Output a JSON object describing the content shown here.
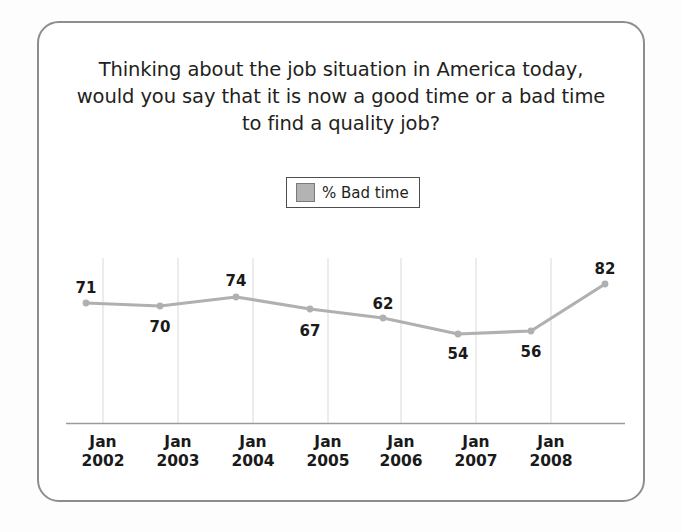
{
  "frame": {
    "border_color": "#8d8d8d",
    "background": "#ffffff"
  },
  "title": {
    "line1": "Thinking about the job situation in America today,",
    "line2": "would you say that it is now a good time or a bad time",
    "line3": "to find a quality job?"
  },
  "legend": {
    "swatch_name": "legend-swatch-bad-time",
    "swatch_color": "#b3b3b3",
    "label": "% Bad time"
  },
  "axis": {
    "tick_labels": [
      {
        "month": "Jan",
        "year": "2002"
      },
      {
        "month": "Jan",
        "year": "2003"
      },
      {
        "month": "Jan",
        "year": "2004"
      },
      {
        "month": "Jan",
        "year": "2005"
      },
      {
        "month": "Jan",
        "year": "2006"
      },
      {
        "month": "Jan",
        "year": "2007"
      },
      {
        "month": "Jan",
        "year": "2008"
      }
    ]
  },
  "chart_data": {
    "type": "line",
    "title": "Thinking about the job situation in America today, would you say that it is now a good time or a bad time to find a quality job?",
    "xlabel": "",
    "ylabel": "",
    "grid": "vertical-only",
    "legend_position": "top-center",
    "series": [
      {
        "name": "% Bad time",
        "color": "#b3b3b3",
        "marker_color": "#b0b0b0",
        "values": [
          71,
          70,
          74,
          67,
          62,
          54,
          56,
          82
        ]
      }
    ],
    "categories": [
      "Jan 2002",
      "Jan 2003",
      "Jan 2004",
      "Jan 2005",
      "Jan 2006",
      "Jan 2007",
      "Jan 2008",
      ""
    ],
    "x_tick_labels": [
      "Jan 2002",
      "Jan 2003",
      "Jan 2004",
      "Jan 2005",
      "Jan 2006",
      "Jan 2007",
      "Jan 2008"
    ],
    "data_labels": [
      "71",
      "70",
      "74",
      "67",
      "62",
      "54",
      "56",
      "82"
    ],
    "ylim": [
      40,
      90
    ],
    "points_px": [
      {
        "label": "71",
        "x": 86,
        "y": 303,
        "label_x": 86,
        "label_y": 279,
        "pos": "above"
      },
      {
        "label": "70",
        "x": 160,
        "y": 306,
        "label_x": 160,
        "label_y": 318,
        "pos": "below"
      },
      {
        "label": "74",
        "x": 236,
        "y": 297,
        "label_x": 236,
        "label_y": 272,
        "pos": "above"
      },
      {
        "label": "67",
        "x": 310,
        "y": 309,
        "label_x": 310,
        "label_y": 322,
        "pos": "below"
      },
      {
        "label": "62",
        "x": 383,
        "y": 318,
        "label_x": 383,
        "label_y": 295,
        "pos": "above"
      },
      {
        "label": "54",
        "x": 458,
        "y": 334,
        "label_x": 458,
        "label_y": 345,
        "pos": "below"
      },
      {
        "label": "56",
        "x": 531,
        "y": 331,
        "label_x": 531,
        "label_y": 343,
        "pos": "below"
      },
      {
        "label": "82",
        "x": 605,
        "y": 284,
        "label_x": 605,
        "label_y": 260,
        "pos": "above"
      }
    ],
    "gridlines_px": [
      103,
      178,
      253,
      328,
      401,
      476,
      551
    ],
    "xlabels_px": [
      103,
      178,
      253,
      328,
      401,
      476,
      551
    ]
  }
}
